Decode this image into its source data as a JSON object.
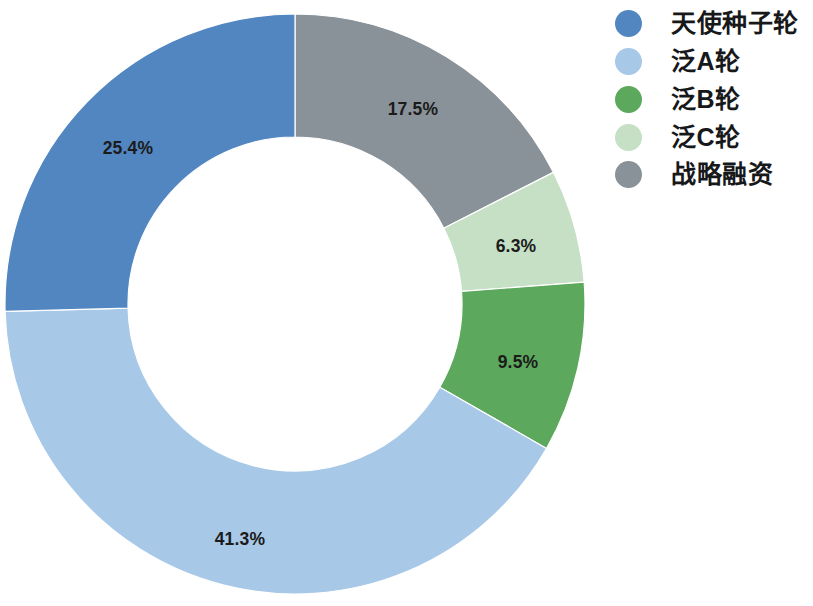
{
  "chart_data": {
    "type": "pie",
    "variant": "donut",
    "title": "",
    "subtitle": "",
    "xlabel": "",
    "ylabel": "",
    "grid": false,
    "legend_position": "right",
    "value_unit": "%",
    "start_angle_deg": 0,
    "direction": "clockwise",
    "center": {
      "cx": 295,
      "cy": 304
    },
    "outer_radius": 290,
    "inner_radius": 167,
    "label_radius": 229,
    "categories": [
      "天使种子轮",
      "泛A轮",
      "泛B轮",
      "泛C轮",
      "战略融资"
    ],
    "values": [
      25.4,
      41.3,
      9.5,
      6.3,
      17.5
    ],
    "colors": [
      "#5186c1",
      "#a8c8e8",
      "#5ca85c",
      "#c5e0c5",
      "#8a9299"
    ],
    "slices": [
      {
        "name": "战略融资",
        "value": 17.5,
        "label": "17.5%",
        "color": "#8a9299",
        "start_pct": 0,
        "end_pct": 17.5,
        "label_x": 413,
        "label_y": 110
      },
      {
        "name": "泛C轮",
        "value": 6.3,
        "label": "6.3%",
        "color": "#c5e0c5",
        "start_pct": 17.5,
        "end_pct": 23.8,
        "label_x": 516,
        "label_y": 247
      },
      {
        "name": "泛B轮",
        "value": 9.5,
        "label": "9.5%",
        "color": "#5ca85c",
        "start_pct": 23.8,
        "end_pct": 33.3,
        "label_x": 518,
        "label_y": 363
      },
      {
        "name": "泛A轮",
        "value": 41.3,
        "label": "41.3%",
        "color": "#a8c8e8",
        "start_pct": 33.3,
        "end_pct": 74.6,
        "label_x": 240,
        "label_y": 540
      },
      {
        "name": "天使种子轮",
        "value": 25.4,
        "label": "25.4%",
        "color": "#5186c1",
        "start_pct": 74.6,
        "end_pct": 100,
        "label_x": 128,
        "label_y": 149
      }
    ]
  },
  "legend": {
    "items": [
      {
        "label": "天使种子轮",
        "color": "#5186c1",
        "marker": "circle-marker",
        "top": 6
      },
      {
        "label": "泛A轮",
        "color": "#a8c8e8",
        "marker": "circle-marker",
        "top": 44
      },
      {
        "label": "泛B轮",
        "color": "#5ca85c",
        "marker": "circle-marker",
        "top": 82
      },
      {
        "label": "泛C轮",
        "color": "#c5e0c5",
        "marker": "circle-marker",
        "top": 120
      },
      {
        "label": "战略融资",
        "color": "#8a9299",
        "marker": "circle-marker",
        "top": 157
      }
    ]
  }
}
